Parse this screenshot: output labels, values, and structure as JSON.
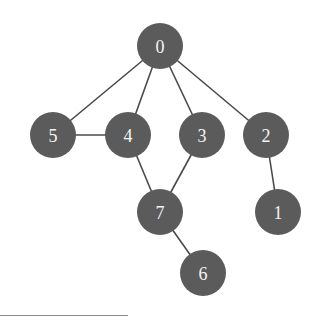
{
  "diagram": {
    "type": "undirected-graph",
    "node_fill": "#5b5b5b",
    "label_color": "#f4f4f4",
    "edge_color": "#4a4a4a",
    "node_radius": 23,
    "nodes": [
      {
        "id": "0",
        "label": "0",
        "x": 160,
        "y": 46
      },
      {
        "id": "1",
        "label": "1",
        "x": 278,
        "y": 212
      },
      {
        "id": "2",
        "label": "2",
        "x": 266,
        "y": 135
      },
      {
        "id": "3",
        "label": "3",
        "x": 202,
        "y": 135
      },
      {
        "id": "4",
        "label": "4",
        "x": 128,
        "y": 135
      },
      {
        "id": "5",
        "label": "5",
        "x": 53,
        "y": 135
      },
      {
        "id": "6",
        "label": "6",
        "x": 203,
        "y": 273
      },
      {
        "id": "7",
        "label": "7",
        "x": 160,
        "y": 212
      }
    ],
    "edges": [
      {
        "from": "0",
        "to": "5"
      },
      {
        "from": "0",
        "to": "4"
      },
      {
        "from": "0",
        "to": "3"
      },
      {
        "from": "0",
        "to": "2"
      },
      {
        "from": "5",
        "to": "4"
      },
      {
        "from": "4",
        "to": "7"
      },
      {
        "from": "3",
        "to": "7"
      },
      {
        "from": "2",
        "to": "1"
      },
      {
        "from": "7",
        "to": "6"
      }
    ]
  }
}
